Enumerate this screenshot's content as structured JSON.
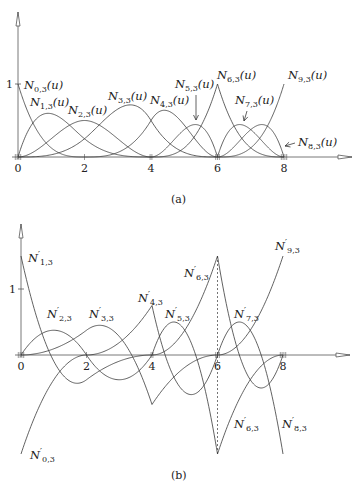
{
  "chart_data": [
    {
      "panel": "(a)",
      "type": "line",
      "title": "",
      "caption": "(a)",
      "description": "Cubic B-spline basis functions N_{i,3}(u), i = 0..9",
      "degree": 3,
      "knots": [
        0,
        0,
        0,
        0,
        2,
        4,
        4,
        6,
        6,
        6,
        8,
        8,
        8,
        8
      ],
      "xlabel": "",
      "ylabel": "",
      "xlim": [
        0,
        8
      ],
      "ylim": [
        0,
        1
      ],
      "x_ticks": [
        "0",
        "2",
        "4",
        "6",
        "8"
      ],
      "y_ticks": [
        "1"
      ],
      "grid": false,
      "legend": "inline labels",
      "series": [
        {
          "name": "N_{0,3}(u)",
          "label": "N0,3(u)"
        },
        {
          "name": "N_{1,3}(u)",
          "label": "N1,3(u)"
        },
        {
          "name": "N_{2,3}(u)",
          "label": "N2,3(u)"
        },
        {
          "name": "N_{3,3}(u)",
          "label": "N3,3(u)"
        },
        {
          "name": "N_{4,3}(u)",
          "label": "N4,3(u)"
        },
        {
          "name": "N_{5,3}(u)",
          "label": "N5,3(u)"
        },
        {
          "name": "N_{6,3}(u)",
          "label": "N6,3(u)"
        },
        {
          "name": "N_{7,3}(u)",
          "label": "N7,3(u)"
        },
        {
          "name": "N_{8,3}(u)",
          "label": "N8,3(u)"
        },
        {
          "name": "N_{9,3}(u)",
          "label": "N9,3(u)"
        }
      ]
    },
    {
      "panel": "(b)",
      "type": "line",
      "title": "",
      "caption": "(b)",
      "description": "Derivatives N'_{i,3}(u) of the cubic B-spline basis functions",
      "degree": 3,
      "knots": [
        0,
        0,
        0,
        0,
        2,
        4,
        4,
        6,
        6,
        6,
        8,
        8,
        8,
        8
      ],
      "xlim": [
        0,
        8
      ],
      "ylim": [
        -2.2,
        1.5
      ],
      "x_ticks": [
        "0",
        "2",
        "4",
        "6",
        "8"
      ],
      "y_ticks": [
        "1"
      ],
      "grid": false,
      "legend": "inline labels",
      "annotations": [
        "dashed vertical line at u = 6"
      ],
      "series": [
        {
          "name": "N'_{0,3}",
          "label": "N'0,3"
        },
        {
          "name": "N'_{1,3}",
          "label": "N'1,3"
        },
        {
          "name": "N'_{2,3}",
          "label": "N'2,3"
        },
        {
          "name": "N'_{3,3}",
          "label": "N'3,3"
        },
        {
          "name": "N'_{4,3}",
          "label": "N'4,3"
        },
        {
          "name": "N'_{5,3}",
          "label": "N'5,3"
        },
        {
          "name": "N'_{6,3}",
          "label": "N'6,3 (upper)"
        },
        {
          "name": "N'_{6,3}",
          "label": "N'6,3 (lower)"
        },
        {
          "name": "N'_{7,3}",
          "label": "N'7,3"
        },
        {
          "name": "N'_{8,3}",
          "label": "N'8,3"
        },
        {
          "name": "N'_{9,3}",
          "label": "N'9,3"
        }
      ]
    }
  ],
  "labels_a": [
    {
      "base": "N",
      "sub": "0,3",
      "arg": "(u)",
      "x": 24,
      "y": 89
    },
    {
      "base": "N",
      "sub": "1,3",
      "arg": "(u)",
      "x": 30,
      "y": 106
    },
    {
      "base": "N",
      "sub": "2,3",
      "arg": "(u)",
      "x": 68,
      "y": 114
    },
    {
      "base": "N",
      "sub": "3,3",
      "arg": "(u)",
      "x": 108,
      "y": 100
    },
    {
      "base": "N",
      "sub": "4,3",
      "arg": "(u)",
      "x": 150,
      "y": 104
    },
    {
      "base": "N",
      "sub": "5,3",
      "arg": "(u)",
      "x": 175,
      "y": 88
    },
    {
      "base": "N",
      "sub": "6,3",
      "arg": "(u)",
      "x": 217,
      "y": 79
    },
    {
      "base": "N",
      "sub": "7,3",
      "arg": "(u)",
      "x": 235,
      "y": 104
    },
    {
      "base": "N",
      "sub": "8,3",
      "arg": "(u)",
      "x": 298,
      "y": 146
    },
    {
      "base": "N",
      "sub": "9,3",
      "arg": "(u)",
      "x": 288,
      "y": 79
    }
  ],
  "labels_b": [
    {
      "base": "N",
      "sub": "1,3",
      "x": 28,
      "y": 262
    },
    {
      "base": "N",
      "sub": "2,3",
      "x": 47,
      "y": 318
    },
    {
      "base": "N",
      "sub": "3,3",
      "x": 89,
      "y": 318
    },
    {
      "base": "N",
      "sub": "4,3",
      "x": 138,
      "y": 302
    },
    {
      "base": "N",
      "sub": "5,3",
      "x": 165,
      "y": 318
    },
    {
      "base": "N",
      "sub": "6,3",
      "x": 184,
      "y": 277
    },
    {
      "base": "N",
      "sub": "7,3",
      "x": 234,
      "y": 318
    },
    {
      "base": "N",
      "sub": "9,3",
      "x": 275,
      "y": 250
    },
    {
      "base": "N",
      "sub": "0,3",
      "x": 30,
      "y": 459
    },
    {
      "base": "N",
      "sub": "6,3",
      "x": 234,
      "y": 428
    },
    {
      "base": "N",
      "sub": "8,3",
      "x": 282,
      "y": 428
    }
  ],
  "ticks": {
    "x": [
      "0",
      "2",
      "4",
      "6",
      "8"
    ],
    "y_one": "1"
  },
  "captions": {
    "a": "(a)",
    "b": "(b)"
  },
  "colors": {
    "curve": "#3a3a3a",
    "axis": "#555555",
    "text": "#222222"
  }
}
